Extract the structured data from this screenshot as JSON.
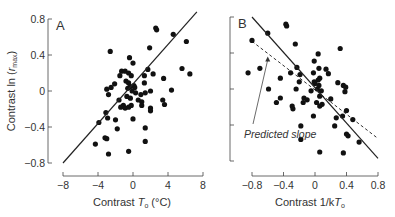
{
  "chart_data": [
    {
      "panel": "A",
      "type": "scatter",
      "title": "",
      "panel_label": "A",
      "xlabel": "Contrast T_o (°C)",
      "xlabel_parts": {
        "pre": "Contrast ",
        "italic": "T",
        "sub": "o",
        "post": " (°C)"
      },
      "ylabel": "Contrast ln (r_max)",
      "ylabel_parts": {
        "pre": "Contrast ln (",
        "italic": "r",
        "sub": "max",
        "post": ")"
      },
      "xlim": [
        -8,
        8
      ],
      "ylim": [
        -0.8,
        0.8
      ],
      "xticks": [
        -8,
        -4,
        0,
        4,
        8
      ],
      "xtick_labels": [
        "−8",
        "−4",
        "0",
        "4",
        "8"
      ],
      "yticks": [
        -0.8,
        -0.4,
        0,
        0.4,
        0.8
      ],
      "ytick_labels": [
        "−0.8",
        "−0.4",
        "0",
        "0.4",
        "0.8"
      ],
      "grid": false,
      "fit_line": {
        "style": "solid",
        "x": [
          -8,
          7.3
        ],
        "y": [
          -0.8,
          0.88
        ]
      },
      "points": [
        [
          -2.6,
          0.44
        ],
        [
          2.6,
          0.7
        ],
        [
          2.7,
          0.68
        ],
        [
          4.6,
          0.63
        ],
        [
          6.1,
          0.55
        ],
        [
          1.9,
          0.48
        ],
        [
          -0.4,
          0.37
        ],
        [
          0.0,
          0.31
        ],
        [
          5.6,
          0.25
        ],
        [
          6.5,
          0.19
        ],
        [
          1.7,
          0.24
        ],
        [
          2.3,
          0.19
        ],
        [
          -1.3,
          0.22
        ],
        [
          -0.9,
          0.22
        ],
        [
          -0.5,
          0.2
        ],
        [
          -1.5,
          0.17
        ],
        [
          1.3,
          0.17
        ],
        [
          3.5,
          0.14
        ],
        [
          -0.2,
          0.17
        ],
        [
          -2.1,
          0.08
        ],
        [
          -2.5,
          0.04
        ],
        [
          -3.0,
          0.02
        ],
        [
          -0.8,
          0.11
        ],
        [
          -0.5,
          0.09
        ],
        [
          -0.3,
          0.05
        ],
        [
          0.1,
          0.06
        ],
        [
          0.2,
          0.04
        ],
        [
          -0.6,
          0.03
        ],
        [
          -0.1,
          0.0
        ],
        [
          1.3,
          0.09
        ],
        [
          2.0,
          0.0
        ],
        [
          4.4,
          0.01
        ],
        [
          -2.8,
          -0.04
        ],
        [
          -1.6,
          -0.1
        ],
        [
          -0.7,
          -0.06
        ],
        [
          -0.3,
          -0.08
        ],
        [
          0.3,
          -0.02
        ],
        [
          0.9,
          -0.04
        ],
        [
          0.6,
          -0.1
        ],
        [
          1.0,
          -0.12
        ],
        [
          1.4,
          -0.02
        ],
        [
          3.4,
          -0.1
        ],
        [
          3.6,
          -0.15
        ],
        [
          -1.1,
          -0.16
        ],
        [
          -0.9,
          -0.19
        ],
        [
          -0.5,
          -0.18
        ],
        [
          -0.2,
          -0.16
        ],
        [
          1.0,
          -0.16
        ],
        [
          -1.4,
          -0.18
        ],
        [
          2.0,
          -0.19
        ],
        [
          2.0,
          -0.22
        ],
        [
          -3.1,
          -0.24
        ],
        [
          -2.9,
          -0.3
        ],
        [
          -2.0,
          -0.32
        ],
        [
          0.0,
          -0.31
        ],
        [
          -3.9,
          -0.35
        ],
        [
          -1.8,
          -0.42
        ],
        [
          1.4,
          -0.41
        ],
        [
          -3.2,
          -0.52
        ],
        [
          -3.0,
          -0.53
        ],
        [
          1.4,
          -0.56
        ],
        [
          -4.3,
          -0.59
        ],
        [
          -2.8,
          -0.7
        ],
        [
          -0.5,
          -0.67
        ]
      ]
    },
    {
      "panel": "B",
      "type": "scatter",
      "title": "",
      "panel_label": "B",
      "xlabel": "Contrast 1/kT_o",
      "xlabel_parts": {
        "pre": "Contrast 1/k",
        "italic": "T",
        "sub": "o",
        "post": ""
      },
      "ylabel": "",
      "xlim": [
        -0.8,
        0.8
      ],
      "ylim": [
        -0.8,
        0.8
      ],
      "xticks": [
        -0.8,
        -0.4,
        0,
        0.4,
        0.8
      ],
      "xtick_labels": [
        "−0.8",
        "−0.4",
        "0",
        "0.4",
        "0.8"
      ],
      "yticks": [
        -0.8,
        -0.4,
        0,
        0.4,
        0.8
      ],
      "ytick_labels": [],
      "grid": false,
      "fit_line": {
        "style": "solid",
        "x": [
          -0.8,
          0.8
        ],
        "y": [
          0.8,
          -0.77
        ]
      },
      "predicted_line": {
        "style": "dashed",
        "x": [
          -0.8,
          0.8
        ],
        "y": [
          0.53,
          -0.55
        ]
      },
      "annotation": {
        "text": "Predicted slope",
        "arrow_to": [
          -0.6,
          0.36
        ]
      },
      "points": [
        [
          -0.37,
          0.72
        ],
        [
          -0.36,
          0.7
        ],
        [
          -0.6,
          0.62
        ],
        [
          -0.8,
          0.54
        ],
        [
          -0.25,
          0.5
        ],
        [
          0.32,
          0.45
        ],
        [
          0.04,
          0.39
        ],
        [
          -0.01,
          0.31
        ],
        [
          -0.23,
          0.24
        ],
        [
          -0.7,
          0.23
        ],
        [
          -0.85,
          0.18
        ],
        [
          -0.31,
          0.18
        ],
        [
          0.05,
          0.23
        ],
        [
          0.14,
          0.22
        ],
        [
          0.17,
          0.17
        ],
        [
          -0.02,
          0.18
        ],
        [
          -0.19,
          0.16
        ],
        [
          -0.44,
          0.12
        ],
        [
          0.06,
          0.12
        ],
        [
          0.04,
          0.1
        ],
        [
          -0.01,
          0.08
        ],
        [
          0.0,
          0.06
        ],
        [
          0.29,
          0.07
        ],
        [
          0.36,
          0.04
        ],
        [
          0.39,
          0.02
        ],
        [
          0.05,
          0.04
        ],
        [
          -0.2,
          0.08
        ],
        [
          0.03,
          0.0
        ],
        [
          -0.05,
          -0.02
        ],
        [
          -0.59,
          0.0
        ],
        [
          -0.24,
          0.0
        ],
        [
          0.38,
          -0.03
        ],
        [
          0.08,
          -0.02
        ],
        [
          0.06,
          -0.08
        ],
        [
          -0.14,
          -0.1
        ],
        [
          -0.44,
          -0.1
        ],
        [
          -0.49,
          -0.15
        ],
        [
          -0.1,
          -0.12
        ],
        [
          -0.15,
          -0.15
        ],
        [
          0.02,
          -0.15
        ],
        [
          0.09,
          -0.17
        ],
        [
          0.06,
          -0.19
        ],
        [
          0.2,
          -0.11
        ],
        [
          -0.29,
          -0.19
        ],
        [
          -0.28,
          -0.22
        ],
        [
          0.4,
          -0.24
        ],
        [
          -0.02,
          -0.3
        ],
        [
          0.35,
          -0.3
        ],
        [
          0.27,
          -0.32
        ],
        [
          0.48,
          -0.34
        ],
        [
          -0.18,
          -0.41
        ],
        [
          0.25,
          -0.41
        ],
        [
          0.4,
          -0.5
        ],
        [
          0.42,
          -0.52
        ],
        [
          -0.18,
          -0.56
        ],
        [
          0.56,
          -0.59
        ],
        [
          0.06,
          -0.7
        ],
        [
          0.36,
          -0.71
        ]
      ]
    }
  ]
}
